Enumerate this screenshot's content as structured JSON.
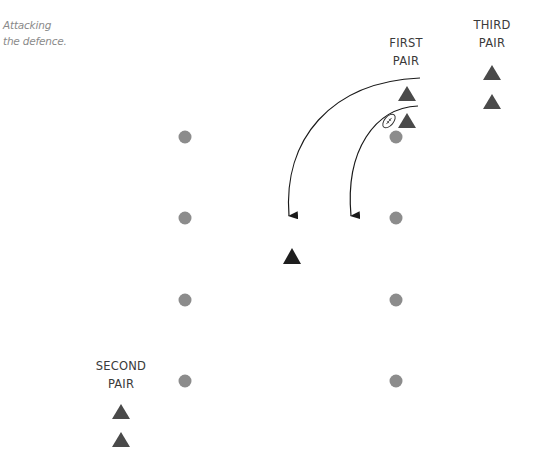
{
  "caption": {
    "line1": "Attacking",
    "line2": "the defence."
  },
  "groups": [
    {
      "id": "first-pair",
      "line1": "FIRST",
      "line2": "PAIR"
    },
    {
      "id": "third-pair",
      "line1": "THIRD",
      "line2": "PAIR"
    },
    {
      "id": "second-pair",
      "line1": "SECOND",
      "line2": "PAIR"
    }
  ],
  "colors": {
    "cone": "#8c8c8c",
    "player": "#4a4a4a",
    "defender": "#1e1e1e",
    "arrow": "#1a1a1a",
    "ball": "#333333"
  },
  "icons": {
    "cone": "grey-circle",
    "player": "dark-triangle",
    "defender": "black-triangle",
    "ball": "rugby-ball-outline",
    "run": "curved-arrow"
  },
  "elements": {
    "cone_count": 8,
    "attacker_count": 6,
    "defender_count": 1,
    "ball_carrier": "first-pair",
    "run_count": 2
  }
}
